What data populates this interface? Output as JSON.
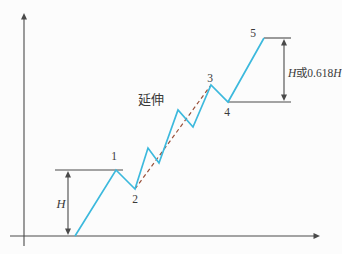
{
  "figure": {
    "width": 342,
    "height": 254,
    "background": "#fcfcfc",
    "axis_color": "#4a4a4a",
    "text_color": "#3a3a3a"
  },
  "chart_data": {
    "type": "line",
    "title": "",
    "grid": false,
    "legend": false,
    "axes": {
      "x_axis": {
        "y": 236,
        "x1": 10,
        "x2": 320,
        "arrow": "right"
      },
      "y_axis": {
        "x": 24,
        "y1": 246,
        "y2": 13,
        "arrow": "up"
      }
    },
    "series": [
      {
        "name": "elliott-wave-path",
        "color": "#3cb9dd",
        "width": 1.7,
        "points": [
          [
            75,
            236
          ],
          [
            116,
            170
          ],
          [
            135,
            189
          ],
          [
            148,
            148
          ],
          [
            159,
            163
          ],
          [
            178,
            110
          ],
          [
            193,
            127
          ],
          [
            211,
            85
          ],
          [
            228,
            102
          ],
          [
            264,
            38
          ]
        ]
      }
    ],
    "trendlines": [
      {
        "name": "wave2-to-wave3-dashed-trendline",
        "color": "#99503a",
        "width": 1.2,
        "dash": "4 3",
        "from": [
          135,
          189
        ],
        "to": [
          211,
          85
        ]
      }
    ],
    "reference_lines": [
      {
        "name": "level-line-point1",
        "x1": 55,
        "x2": 123,
        "y": 170
      },
      {
        "name": "level-line-point5",
        "x1": 264,
        "x2": 291,
        "y": 38
      },
      {
        "name": "level-line-point4",
        "x1": 228,
        "x2": 291,
        "y": 102
      }
    ],
    "measure_arrows": [
      {
        "name": "height-H-arrow",
        "x": 68,
        "y1": 171,
        "y2": 235
      },
      {
        "name": "height-H618-arrow",
        "x": 284,
        "y1": 39,
        "y2": 101
      }
    ],
    "labels": [
      {
        "name": "point-label-1",
        "x": 114,
        "y": 160,
        "anchor": "middle",
        "size": 11.5,
        "parts": [
          {
            "text": "1",
            "italic": false
          }
        ]
      },
      {
        "name": "point-label-2",
        "x": 135,
        "y": 203,
        "anchor": "middle",
        "size": 11.5,
        "parts": [
          {
            "text": "2",
            "italic": false
          }
        ]
      },
      {
        "name": "point-label-3",
        "x": 210,
        "y": 82,
        "anchor": "middle",
        "size": 11.5,
        "parts": [
          {
            "text": "3",
            "italic": false
          }
        ]
      },
      {
        "name": "point-label-4",
        "x": 227,
        "y": 116,
        "anchor": "middle",
        "size": 11.5,
        "parts": [
          {
            "text": "4",
            "italic": false
          }
        ]
      },
      {
        "name": "point-label-5",
        "x": 253,
        "y": 37,
        "anchor": "middle",
        "size": 11.5,
        "parts": [
          {
            "text": "5",
            "italic": false
          }
        ]
      },
      {
        "name": "extension-label",
        "x": 151,
        "y": 104,
        "anchor": "middle",
        "size": 13,
        "parts": [
          {
            "text": "延伸",
            "italic": false
          }
        ]
      },
      {
        "name": "height-H-label",
        "x": 61,
        "y": 208,
        "anchor": "middle",
        "size": 12.5,
        "parts": [
          {
            "text": "H",
            "italic": true
          }
        ]
      },
      {
        "name": "height-H618-label",
        "x": 288,
        "y": 77,
        "anchor": "start",
        "size": 11.5,
        "parts": [
          {
            "text": "H",
            "italic": true
          },
          {
            "text": "或",
            "italic": false
          },
          {
            "text": "0.618",
            "italic": false
          },
          {
            "text": "H",
            "italic": true
          }
        ]
      }
    ]
  }
}
